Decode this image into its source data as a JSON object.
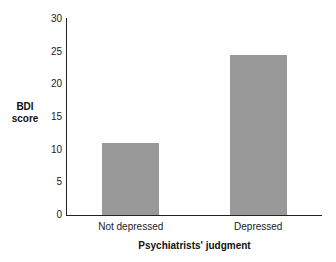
{
  "chart_data": {
    "type": "bar",
    "title": "",
    "subtitle": "",
    "xlabel": "Psychiatrists' judgment",
    "ylabel": "BDI score",
    "ylabel_lines": [
      "BDI",
      "score"
    ],
    "categories": [
      "Not depressed",
      "Depressed"
    ],
    "values": [
      11,
      24.5
    ],
    "ylim": [
      0,
      30
    ],
    "yticks": [
      0,
      5,
      10,
      15,
      20,
      25,
      30
    ],
    "ytick_labels": [
      "0",
      "5",
      "10",
      "15",
      "20",
      "25",
      "30"
    ],
    "grid": false,
    "legend": false,
    "legend_position": "none",
    "bar_color": "#999999",
    "axis_color": "#222222",
    "background_color": "#ffffff",
    "annotations": []
  }
}
